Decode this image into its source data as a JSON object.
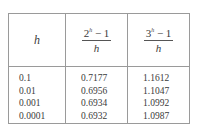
{
  "table": {
    "headers": [
      {
        "type": "var",
        "text": "h"
      },
      {
        "type": "frac",
        "base": "2",
        "exp": "h",
        "rest": " − 1",
        "den": "h"
      },
      {
        "type": "frac",
        "base": "3",
        "exp": "h",
        "rest": " − 1",
        "den": "h"
      }
    ],
    "columns": {
      "h": [
        "0.1",
        "0.01",
        "0.001",
        "0.0001"
      ],
      "two": [
        "0.7177",
        "0.6956",
        "0.6934",
        "0.6932"
      ],
      "three": [
        "1.1612",
        "1.1047",
        "1.0992",
        "1.0987"
      ]
    }
  }
}
